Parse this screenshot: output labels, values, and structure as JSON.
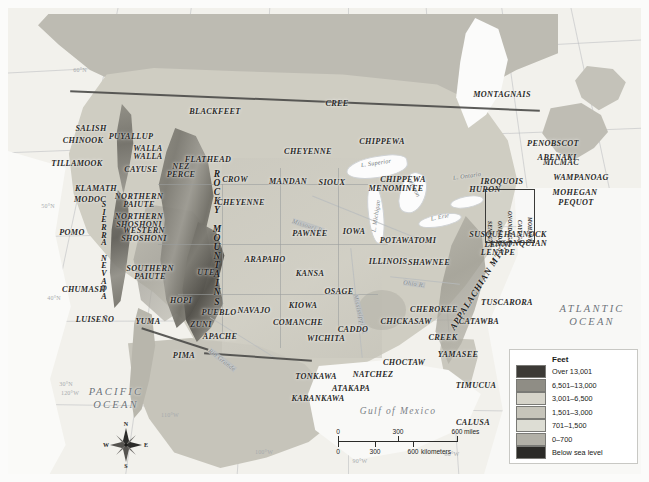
{
  "map": {
    "title": "Native American Culture Areas and Physical Relief of North America",
    "oceans": [
      {
        "name": "pacific-ocean",
        "line1": "PACIFIC",
        "line2": "OCEAN",
        "x": 108,
        "y": 390
      },
      {
        "name": "atlantic-ocean",
        "line1": "ATLANTIC",
        "line2": "OCEAN",
        "x": 584,
        "y": 307
      }
    ],
    "gulf": {
      "label": "Gulf of Mexico",
      "x": 390,
      "y": 404
    },
    "lakes": [
      {
        "label": "L. Superior",
        "x": 368,
        "y": 155,
        "rotate": -8
      },
      {
        "label": "L. Michigan",
        "x": 368,
        "y": 208,
        "rotate": -82
      },
      {
        "label": "L. Huron",
        "x": 405,
        "y": 178,
        "rotate": 62
      },
      {
        "label": "L. Erie",
        "x": 432,
        "y": 209,
        "rotate": -12
      },
      {
        "label": "L. Ontario",
        "x": 459,
        "y": 168,
        "rotate": -8
      }
    ],
    "rivers": [
      {
        "label": "Ohio R.",
        "x": 406,
        "y": 276,
        "rotate": 8
      },
      {
        "label": "Mississippi R.",
        "x": 352,
        "y": 306,
        "rotate": 76
      },
      {
        "label": "Missouri R.",
        "x": 300,
        "y": 218,
        "rotate": 18
      },
      {
        "label": "Rio Grande",
        "x": 214,
        "y": 352,
        "rotate": 38
      }
    ],
    "ranges": [
      {
        "name": "rocky-mountains",
        "label": "ROCKY MOUNTAINS",
        "x": 209,
        "y": 230
      },
      {
        "name": "sierra-nevada",
        "label": "SIERRA NEVADA",
        "x": 96,
        "y": 243
      },
      {
        "name": "appalachian-mts",
        "label": "APPALACHIAN MTS.",
        "x": 470,
        "y": 279,
        "rotate": -58
      }
    ],
    "coordinates": [
      {
        "label": "60°N",
        "x": 72,
        "y": 62
      },
      {
        "label": "50°N",
        "x": 40,
        "y": 198
      },
      {
        "label": "40°N",
        "x": 46,
        "y": 290
      },
      {
        "label": "30°N",
        "x": 58,
        "y": 376
      },
      {
        "label": "120°W",
        "x": 62,
        "y": 385
      },
      {
        "label": "110°W",
        "x": 162,
        "y": 407
      },
      {
        "label": "100°W",
        "x": 256,
        "y": 444
      },
      {
        "label": "90°W",
        "x": 352,
        "y": 453
      },
      {
        "label": "80°W",
        "x": 444,
        "y": 446
      },
      {
        "label": "70°W",
        "x": 530,
        "y": 420
      }
    ],
    "tribes": [
      {
        "label": "BLACKFEET",
        "x": 207,
        "y": 104
      },
      {
        "label": "CREE",
        "x": 329,
        "y": 96
      },
      {
        "label": "MONTAGNAIS",
        "x": 494,
        "y": 87
      },
      {
        "label": "MICMAC",
        "x": 553,
        "y": 155
      },
      {
        "label": "SALISH",
        "x": 83,
        "y": 121
      },
      {
        "label": "CHINOOK",
        "x": 75,
        "y": 133
      },
      {
        "label": "PUYALLUP",
        "x": 123,
        "y": 129
      },
      {
        "label": "TILLAMOOK",
        "x": 69,
        "y": 156
      },
      {
        "label": "WALLA\nWALLA",
        "x": 140,
        "y": 145
      },
      {
        "label": "CAYUSE",
        "x": 133,
        "y": 162
      },
      {
        "label": "NEZ\nPERCE",
        "x": 173,
        "y": 163
      },
      {
        "label": "FLATHEAD",
        "x": 200,
        "y": 152
      },
      {
        "label": "CHEYENNE",
        "x": 300,
        "y": 144
      },
      {
        "label": "CHIPPEWA",
        "x": 374,
        "y": 134
      },
      {
        "label": "KLAMATH",
        "x": 88,
        "y": 181
      },
      {
        "label": "MODOC",
        "x": 82,
        "y": 192
      },
      {
        "label": "NORTHERN\nPAIUTE",
        "x": 131,
        "y": 193
      },
      {
        "label": "CROW",
        "x": 227,
        "y": 172
      },
      {
        "label": "MANDAN",
        "x": 280,
        "y": 174
      },
      {
        "label": "SIOUX",
        "x": 324,
        "y": 175
      },
      {
        "label": "CHIPPEWA",
        "x": 395,
        "y": 172
      },
      {
        "label": "MENOMINEE",
        "x": 388,
        "y": 181
      },
      {
        "label": "HURON",
        "x": 477,
        "y": 182
      },
      {
        "label": "IROQUOIS",
        "x": 494,
        "y": 174
      },
      {
        "label": "PENOBSCOT",
        "x": 545,
        "y": 136
      },
      {
        "label": "ABENAKI",
        "x": 549,
        "y": 150
      },
      {
        "label": "WAMPANOAG",
        "x": 573,
        "y": 170
      },
      {
        "label": "MOHEGAN",
        "x": 567,
        "y": 185
      },
      {
        "label": "PEQUOT",
        "x": 568,
        "y": 195
      },
      {
        "label": "SUSQUEHANNOCK",
        "x": 500,
        "y": 227
      },
      {
        "label": "ALGONQUIAN",
        "x": 510,
        "y": 236
      },
      {
        "label": "LENNI\nLENAPE",
        "x": 490,
        "y": 241
      },
      {
        "label": "CHEYENNE",
        "x": 233,
        "y": 195
      },
      {
        "label": "NORTHERN\nSHOSHONI",
        "x": 131,
        "y": 213
      },
      {
        "label": "WESTERN\nSHOSHONI",
        "x": 136,
        "y": 227
      },
      {
        "label": "POMO",
        "x": 64,
        "y": 225
      },
      {
        "label": "PAWNEE",
        "x": 302,
        "y": 226
      },
      {
        "label": "IOWA",
        "x": 346,
        "y": 224
      },
      {
        "label": "POTAWATOMI",
        "x": 400,
        "y": 233
      },
      {
        "label": "UTE",
        "x": 198,
        "y": 265
      },
      {
        "label": "ARAPAHO",
        "x": 257,
        "y": 252
      },
      {
        "label": "KANSA",
        "x": 302,
        "y": 266
      },
      {
        "label": "OSAGE",
        "x": 331,
        "y": 284
      },
      {
        "label": "ILLINOIS",
        "x": 380,
        "y": 254
      },
      {
        "label": "SHAWNEE",
        "x": 421,
        "y": 255
      },
      {
        "label": "SOUTHERN\nPAIUTE",
        "x": 142,
        "y": 265
      },
      {
        "label": "CHUMASH",
        "x": 76,
        "y": 282
      },
      {
        "label": "HOPI",
        "x": 173,
        "y": 293
      },
      {
        "label": "PUEBLO",
        "x": 211,
        "y": 305
      },
      {
        "label": "ZUNI",
        "x": 193,
        "y": 317
      },
      {
        "label": "NAVAJO",
        "x": 246,
        "y": 303
      },
      {
        "label": "KIOWA",
        "x": 295,
        "y": 298
      },
      {
        "label": "COMANCHE",
        "x": 290,
        "y": 315
      },
      {
        "label": "CHEROKEE",
        "x": 426,
        "y": 302
      },
      {
        "label": "TUSCARORA",
        "x": 499,
        "y": 295
      },
      {
        "label": "CATAWBA",
        "x": 471,
        "y": 314
      },
      {
        "label": "CHICKASAW",
        "x": 398,
        "y": 314
      },
      {
        "label": "LUISEÑO",
        "x": 87,
        "y": 312
      },
      {
        "label": "YUMA",
        "x": 140,
        "y": 314
      },
      {
        "label": "APACHE",
        "x": 212,
        "y": 329
      },
      {
        "label": "WICHITA",
        "x": 318,
        "y": 331
      },
      {
        "label": "CREEK",
        "x": 435,
        "y": 330
      },
      {
        "label": "YAMASEE",
        "x": 450,
        "y": 347
      },
      {
        "label": "CADDO",
        "x": 345,
        "y": 322
      },
      {
        "label": "PIMA",
        "x": 176,
        "y": 348
      },
      {
        "label": "CHOCTAW",
        "x": 396,
        "y": 355
      },
      {
        "label": "TONKAWA",
        "x": 308,
        "y": 369
      },
      {
        "label": "NATCHEZ",
        "x": 365,
        "y": 367
      },
      {
        "label": "ATAKAPA",
        "x": 343,
        "y": 381
      },
      {
        "label": "KARANKAWA",
        "x": 310,
        "y": 391
      },
      {
        "label": "TIMUCUA",
        "x": 468,
        "y": 378
      },
      {
        "label": "CALUSA",
        "x": 465,
        "y": 415
      }
    ],
    "iroquois_members": [
      "SENECA",
      "ONEIDA",
      "ONONDAGA",
      "CAYUGA",
      "MOHAWK"
    ]
  },
  "legend": {
    "title": "Feet",
    "entries": [
      {
        "label": "Over 13,001",
        "color": "#3c3a36"
      },
      {
        "label": "6,501–13,000",
        "color": "#8f8d85"
      },
      {
        "label": "3,001–6,500",
        "color": "#d6d4ca"
      },
      {
        "label": "1,501–3,000",
        "color": "#c6c4ba"
      },
      {
        "label": "701–1,500",
        "color": "#ddddd4"
      },
      {
        "label": "0–700",
        "color": "#b2b0a7"
      },
      {
        "label": "Below sea level",
        "color": "#2b2a27"
      }
    ]
  },
  "scalebar": {
    "miles_ticks": [
      "0",
      "300",
      "600"
    ],
    "miles_unit": "miles",
    "km_ticks": [
      "0",
      "300",
      "600"
    ],
    "km_unit": "kilometers"
  },
  "compass": {
    "north": "N",
    "east": "E",
    "south": "S",
    "west": "W"
  }
}
